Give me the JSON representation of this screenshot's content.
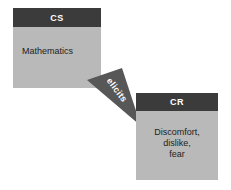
{
  "diagram": {
    "background_color": "#ffffff",
    "node_header_color": "#3b3b3b",
    "node_body_color": "#b9b9b9",
    "node_header_text_color": "#ffffff",
    "node_body_text_color": "#1d1d1d",
    "arrow_color": "#575757",
    "arrow_label_text_color": "#ffffff",
    "nodes": [
      {
        "id": "cs",
        "header": "CS",
        "body": "Mathematics"
      },
      {
        "id": "cr",
        "header": "CR",
        "body_lines": [
          "Discomfort,",
          "dislike,",
          "fear"
        ]
      }
    ],
    "arrow": {
      "label": "elicits",
      "from": "cs",
      "to": "cr",
      "shape": "tapered-triangle",
      "direction": "down-right"
    }
  }
}
